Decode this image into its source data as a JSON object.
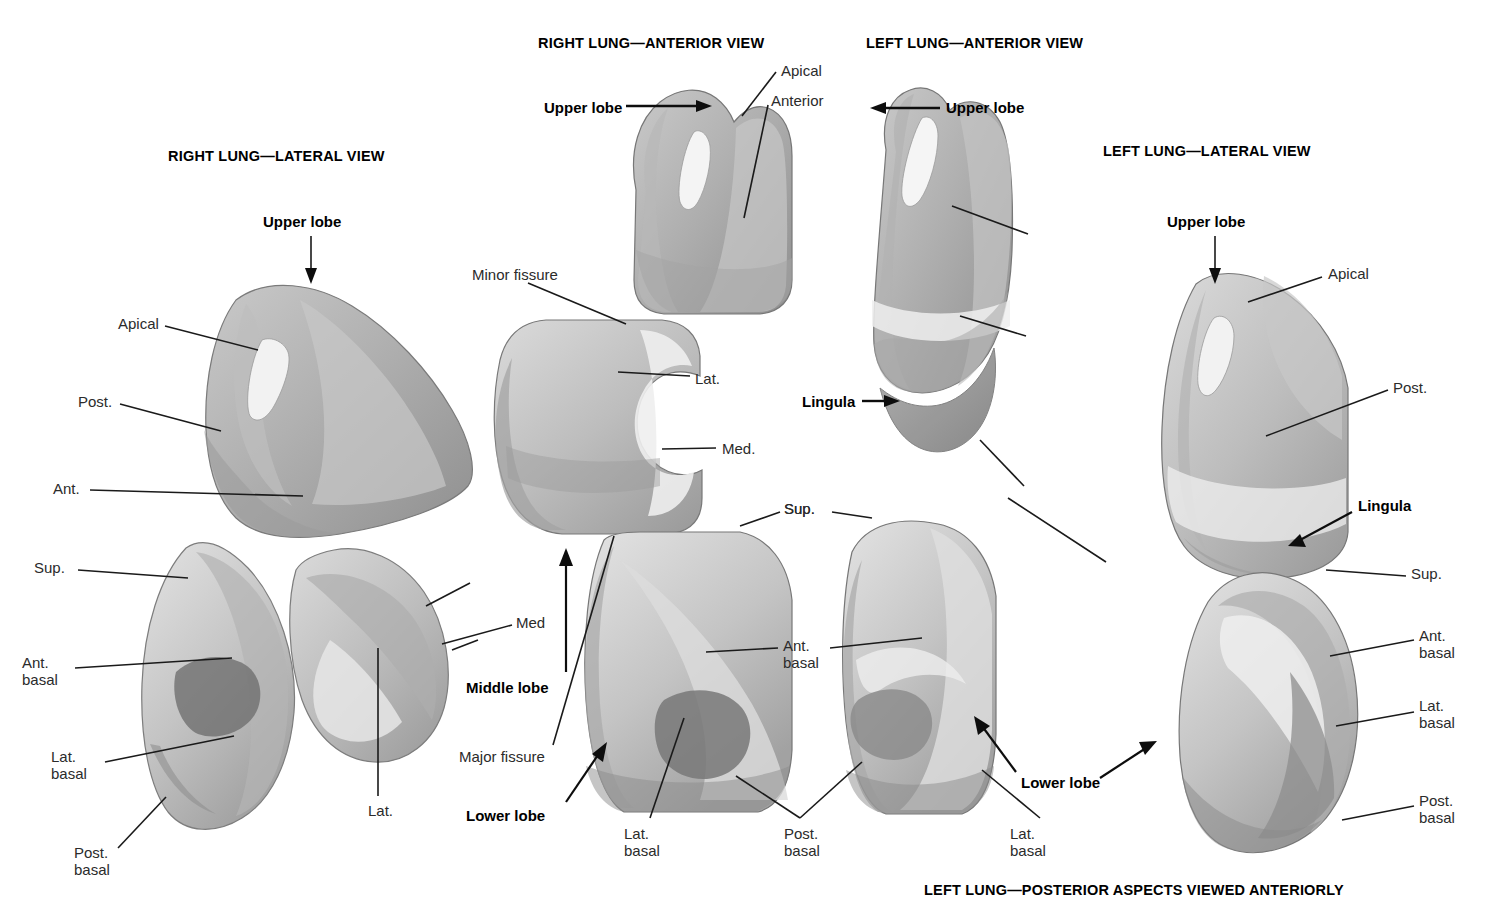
{
  "figure": {
    "kind": "anatomical-plate",
    "background": "#ffffff",
    "ink": "#1a1a1a"
  },
  "view_titles": [
    {
      "id": "right-lateral",
      "text": "RIGHT LUNG—LATERAL VIEW",
      "x": 168,
      "y": 148
    },
    {
      "id": "right-anterior",
      "text": "RIGHT LUNG—ANTERIOR VIEW",
      "x": 538,
      "y": 35
    },
    {
      "id": "left-anterior",
      "text": "LEFT LUNG—ANTERIOR VIEW",
      "x": 866,
      "y": 35
    },
    {
      "id": "left-lateral",
      "text": "LEFT LUNG—LATERAL VIEW",
      "x": 1103,
      "y": 143
    }
  ],
  "caption": {
    "text": "LEFT LUNG—POSTERIOR ASPECTS VIEWED ANTERIORLY",
    "x": 924,
    "y": 898
  },
  "labels": [
    {
      "id": "rl-upper-lobe",
      "text": "Upper lobe",
      "x": 263,
      "y": 214,
      "bold": true
    },
    {
      "id": "rl-apical",
      "text": "Apical",
      "x": 118,
      "y": 316,
      "bold": false
    },
    {
      "id": "rl-post",
      "text": "Post.",
      "x": 78,
      "y": 394,
      "bold": false
    },
    {
      "id": "rl-ant",
      "text": "Ant.",
      "x": 53,
      "y": 481,
      "bold": false
    },
    {
      "id": "rl-sup",
      "text": "Sup.",
      "x": 34,
      "y": 560,
      "bold": false
    },
    {
      "id": "rl-ant-basal",
      "text": "Ant.\nbasal",
      "x": 22,
      "y": 655,
      "bold": false
    },
    {
      "id": "rl-lat-basal",
      "text": "Lat.\nbasal",
      "x": 51,
      "y": 749,
      "bold": false
    },
    {
      "id": "rl-post-basal",
      "text": "Post.\nbasal",
      "x": 74,
      "y": 845,
      "bold": false
    },
    {
      "id": "rl-lat",
      "text": "Lat.",
      "x": 368,
      "y": 803,
      "bold": false
    },
    {
      "id": "ra-upper-lobe",
      "text": "Upper lobe",
      "x": 544,
      "y": 100,
      "bold": true
    },
    {
      "id": "ra-apical",
      "text": "Apical",
      "x": 781,
      "y": 63,
      "bold": false
    },
    {
      "id": "ra-anterior",
      "text": "Anterior",
      "x": 771,
      "y": 93,
      "bold": false
    },
    {
      "id": "ra-minor-fissure",
      "text": "Minor fissure",
      "x": 472,
      "y": 267,
      "bold": false
    },
    {
      "id": "ra-lat",
      "text": "Lat.",
      "x": 695,
      "y": 371,
      "bold": false
    },
    {
      "id": "ra-med-dot",
      "text": "Med.",
      "x": 722,
      "y": 441,
      "bold": false
    },
    {
      "id": "ra-med",
      "text": "Med",
      "x": 516,
      "y": 615,
      "bold": false
    },
    {
      "id": "ra-middle-lobe",
      "text": "Middle lobe",
      "x": 466,
      "y": 680,
      "bold": true
    },
    {
      "id": "ra-major-fissure",
      "text": "Major fissure",
      "x": 459,
      "y": 749,
      "bold": false
    },
    {
      "id": "ra-lower-lobe",
      "text": "Lower lobe",
      "x": 466,
      "y": 808,
      "bold": true
    },
    {
      "id": "ra-sup",
      "text": "Sup.",
      "x": 784,
      "y": 501,
      "bold": false
    },
    {
      "id": "ra-ant-basal",
      "text": "Ant.\nbasal",
      "x": 783,
      "y": 638,
      "bold": false
    },
    {
      "id": "ra-lat-basal",
      "text": "Lat.\nbasal",
      "x": 624,
      "y": 826,
      "bold": false
    },
    {
      "id": "ra-post-basal",
      "text": "Post.\nbasal",
      "x": 784,
      "y": 826,
      "bold": false
    },
    {
      "id": "la-upper-lobe",
      "text": "Upper lobe",
      "x": 946,
      "y": 100,
      "bold": true
    },
    {
      "id": "la-lingula",
      "text": "Lingula",
      "x": 802,
      "y": 394,
      "bold": true
    },
    {
      "id": "la-sup",
      "text": "Sup.",
      "x": 784,
      "y": 501,
      "bold": false
    },
    {
      "id": "la-lower-lobe",
      "text": "Lower lobe",
      "x": 1021,
      "y": 775,
      "bold": true
    },
    {
      "id": "la-lat-basal",
      "text": "Lat.\nbasal",
      "x": 1010,
      "y": 826,
      "bold": false
    },
    {
      "id": "ll-upper-lobe",
      "text": "Upper lobe",
      "x": 1167,
      "y": 214,
      "bold": true
    },
    {
      "id": "ll-apical",
      "text": "Apical",
      "x": 1328,
      "y": 266,
      "bold": false
    },
    {
      "id": "ll-post",
      "text": "Post.",
      "x": 1393,
      "y": 380,
      "bold": false
    },
    {
      "id": "ll-lingula",
      "text": "Lingula",
      "x": 1358,
      "y": 498,
      "bold": true
    },
    {
      "id": "ll-sup",
      "text": "Sup.",
      "x": 1411,
      "y": 566,
      "bold": false
    },
    {
      "id": "ll-ant-basal",
      "text": "Ant.\nbasal",
      "x": 1419,
      "y": 628,
      "bold": false
    },
    {
      "id": "ll-lat-basal",
      "text": "Lat.\nbasal",
      "x": 1419,
      "y": 698,
      "bold": false
    },
    {
      "id": "ll-post-basal",
      "text": "Post.\nbasal",
      "x": 1419,
      "y": 793,
      "bold": false
    }
  ],
  "specimens": [
    {
      "id": "right-lateral-upper",
      "name": "right-upper-lobe-lateral"
    },
    {
      "id": "right-lateral-lower",
      "name": "right-lower-lobe-lateral"
    },
    {
      "id": "right-middle-lobe",
      "name": "right-middle-lobe"
    },
    {
      "id": "right-anterior-upper",
      "name": "right-upper-lobe-anterior"
    },
    {
      "id": "right-anterior-mid",
      "name": "right-middle-lobe-anterior"
    },
    {
      "id": "right-anterior-lower",
      "name": "right-lower-lobe-anterior"
    },
    {
      "id": "left-anterior-upper",
      "name": "left-upper-lobe-anterior"
    },
    {
      "id": "left-anterior-lower",
      "name": "left-lower-lobe-anterior"
    },
    {
      "id": "left-lateral-upper",
      "name": "left-upper-lobe-lateral"
    },
    {
      "id": "left-lateral-lower",
      "name": "left-lower-lobe-lateral"
    }
  ]
}
